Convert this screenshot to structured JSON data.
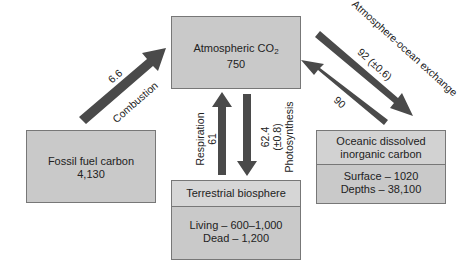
{
  "diagram": {
    "type": "carbon-cycle",
    "colors": {
      "box_fill": "#c9c9c9",
      "box_header_fill": "#d6d6d6",
      "box_border": "#777777",
      "arrow": "#4a4a4a",
      "background": "#ffffff"
    },
    "reservoirs": {
      "atmosphere": {
        "title": "Atmospheric CO",
        "title_sub": "2",
        "value": "750"
      },
      "fossil": {
        "title": "Fossil fuel carbon",
        "value": "4,130"
      },
      "terrestrial": {
        "title": "Terrestrial biosphere",
        "line1": "Living – 600–1,000",
        "line2": "Dead – 1,200"
      },
      "ocean": {
        "title1": "Oceanic dissolved",
        "title2": "inorganic carbon",
        "line1": "Surface – 1020",
        "line2": "Depths – 38,100"
      }
    },
    "fluxes": {
      "combustion": {
        "value": "6.6",
        "label": "Combustion"
      },
      "respiration": {
        "label": "Respiration",
        "value": "61"
      },
      "photosynthesis": {
        "value": "62.4",
        "uncertainty": "(±0.8)",
        "label": "Photosynthesis"
      },
      "exchange": {
        "label": "Atmosphere-ocean exchange",
        "to_ocean": "92 (±0.6)",
        "to_atmosphere": "90"
      }
    }
  }
}
